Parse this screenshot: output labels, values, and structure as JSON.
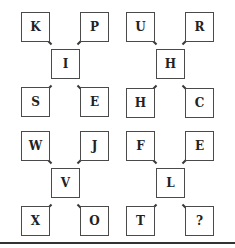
{
  "puzzle": {
    "groups": [
      {
        "center": "I",
        "top_left": "K",
        "top_right": "P",
        "bottom_left": "S",
        "bottom_right": "E"
      },
      {
        "center": "H",
        "top_left": "U",
        "top_right": "R",
        "bottom_left": "H",
        "bottom_right": "C"
      },
      {
        "center": "V",
        "top_left": "W",
        "top_right": "J",
        "bottom_left": "X",
        "bottom_right": "O"
      },
      {
        "center": "L",
        "top_left": "F",
        "top_right": "E",
        "bottom_left": "T",
        "bottom_right": "?"
      }
    ]
  },
  "colors": {
    "border": "#4a4a4a",
    "text": "#222222",
    "background": "#ffffff"
  }
}
